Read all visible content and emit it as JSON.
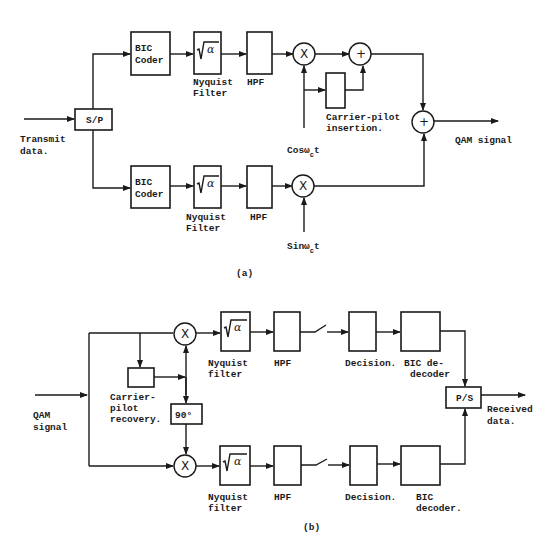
{
  "figure_a": {
    "caption": "(a)",
    "input_label_1": "Transmit",
    "input_label_2": "data.",
    "sp_block": "S/P",
    "upper": {
      "coder_1": "BIC",
      "coder_2": "Coder",
      "filter_symbol": "√α",
      "filter_label_1": "Nyquist",
      "filter_label_2": "Filter",
      "hpf_label": "HPF",
      "mixer_symbol": "X",
      "adder_symbol": "+"
    },
    "lower": {
      "coder_1": "BIC",
      "coder_2": "Coder",
      "filter_symbol": "√α",
      "filter_label_1": "Nyquist",
      "filter_label_2": "Filter",
      "hpf_label": "HPF",
      "mixer_symbol": "X"
    },
    "carrier_pilot_1": "Carrier-pilot",
    "carrier_pilot_2": "insertion.",
    "cos_label": "Cosω",
    "cos_sub": "c",
    "cos_t": "t",
    "sin_label": "Sinω",
    "sin_sub": "c",
    "sin_t": "t",
    "final_adder": "+",
    "output_label": "QAM signal"
  },
  "figure_b": {
    "caption": "(b)",
    "input_label_1": "QAM",
    "input_label_2": "signal",
    "recovery_1": "Carrier-",
    "recovery_2": "pilot",
    "recovery_3": "recovery.",
    "phase_shift": "90°",
    "upper": {
      "mixer_symbol": "X",
      "filter_symbol": "√α",
      "filter_label_1": "Nyquist",
      "filter_label_2": "filter",
      "hpf_label": "HPF",
      "decision_label": "Decision.",
      "decoder_1": "BIC de-",
      "decoder_2": "decoder"
    },
    "lower": {
      "mixer_symbol": "X",
      "filter_symbol": "√α",
      "filter_label_1": "Nyquist",
      "filter_label_2": "filter",
      "hpf_label": "HPF",
      "decision_label": "Decision.",
      "decoder_1": "BIC",
      "decoder_2": "decoder."
    },
    "ps_block": "P/S",
    "output_label_1": "Received",
    "output_label_2": "data."
  }
}
